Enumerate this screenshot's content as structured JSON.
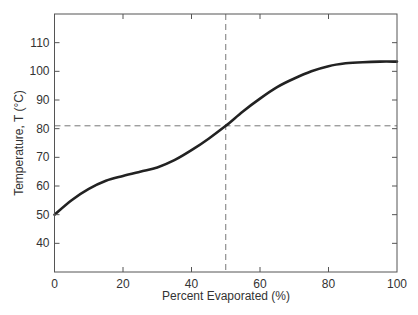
{
  "chart_data": {
    "type": "line",
    "title": "",
    "xlabel": "Percent Evaporated (%)",
    "ylabel": "Temperature, T (°C)",
    "xlim": [
      0,
      100
    ],
    "ylim": [
      30,
      120
    ],
    "xticks": [
      0,
      20,
      40,
      60,
      80,
      100
    ],
    "yticks": [
      40,
      50,
      60,
      70,
      80,
      90,
      100,
      110
    ],
    "grid": false,
    "legend": null,
    "series": [
      {
        "name": "Distillation curve",
        "color": "#222222",
        "x": [
          0,
          5,
          10,
          15,
          20,
          25,
          30,
          35,
          40,
          45,
          50,
          55,
          60,
          65,
          70,
          75,
          80,
          85,
          90,
          95,
          100
        ],
        "y": [
          50,
          55,
          59,
          61.8,
          63.5,
          65,
          66.5,
          69,
          72.5,
          76.5,
          81,
          86,
          90.5,
          94.5,
          97.5,
          100,
          101.8,
          102.8,
          103.2,
          103.4,
          103.4
        ]
      }
    ],
    "reference_lines": [
      {
        "orientation": "vertical",
        "x": 50,
        "style": "dashed",
        "color": "#777777"
      },
      {
        "orientation": "horizontal",
        "y": 81,
        "style": "dashed",
        "color": "#777777"
      }
    ]
  }
}
